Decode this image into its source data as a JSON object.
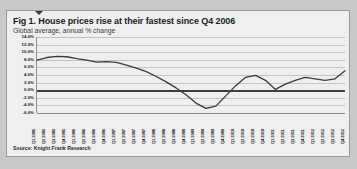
{
  "figure": {
    "title": "Fig 1. House prices rise at their fastest since Q4 2006",
    "subtitle": "Global average, annual % change",
    "source": "Source: Knight Frank Research"
  },
  "chart_data": {
    "type": "line",
    "title": "Fig 1. House prices rise at their fastest since Q4 2006",
    "subtitle": "Global average, annual % change",
    "xlabel": "",
    "ylabel": "annual % change",
    "ylim": [
      -6,
      14
    ],
    "yticks": [
      14,
      12,
      10,
      8,
      6,
      4,
      2,
      0,
      -2,
      -4,
      -6
    ],
    "ytick_labels": [
      "14.0%",
      "12.0%",
      "10.0%",
      "8.0%",
      "6.0%",
      "4.0%",
      "2.0%",
      "0.0%",
      "-2.0%",
      "-4.0%",
      "-6.0%"
    ],
    "grid": true,
    "legend": "none",
    "line_color": "#3a3a3a",
    "categories": [
      "Q1 2005",
      "Q2 2005",
      "Q3 2005",
      "Q4 2005",
      "Q1 2006",
      "Q2 2006",
      "Q3 2006",
      "Q4 2006",
      "Q1 2007",
      "Q2 2007",
      "Q3 2007",
      "Q4 2007",
      "Q1 2008",
      "Q2 2008",
      "Q3 2008",
      "Q4 2008",
      "Q1 2009",
      "Q2 2009",
      "Q3 2009",
      "Q4 2009",
      "Q1 2010",
      "Q2 2010",
      "Q3 2010",
      "Q4 2010",
      "Q1 2011",
      "Q2 2011",
      "Q3 2011",
      "Q4 2011",
      "Q1 2012",
      "Q2 2012",
      "Q3 2012",
      "Q4 2012"
    ],
    "values": [
      7.9,
      8.6,
      8.9,
      8.8,
      8.3,
      7.9,
      7.4,
      7.5,
      7.3,
      6.6,
      5.8,
      4.9,
      3.6,
      2.2,
      0.6,
      -1.2,
      -3.4,
      -4.8,
      -4.2,
      -1.5,
      1.2,
      3.4,
      3.9,
      2.6,
      0.2,
      1.6,
      2.6,
      3.4,
      3.0,
      2.6,
      3.0,
      5.1
    ],
    "annotation": "Latest reading is the fastest rate of growth since Q4 2006"
  }
}
